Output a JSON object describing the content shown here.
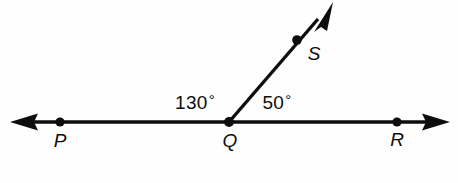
{
  "figure": {
    "background_color": "#fffefe",
    "stroke_color": "#0d0d0d",
    "width": 458,
    "height": 183
  },
  "points": [
    {
      "id": "P",
      "label": "P",
      "dot_x": 60,
      "dot_y": 122,
      "label_x": 60,
      "label_y": 131
    },
    {
      "id": "Q",
      "label": "Q",
      "dot_x": 229,
      "dot_y": 122,
      "label_x": 230,
      "label_y": 131
    },
    {
      "id": "R",
      "label": "R",
      "dot_x": 397,
      "dot_y": 122,
      "label_x": 397,
      "label_y": 130
    },
    {
      "id": "S",
      "label": "S",
      "dot_x": 297,
      "dot_y": 40,
      "label_x": 314,
      "label_y": 44
    }
  ],
  "lines": [
    {
      "id": "line-PR",
      "from": "P-arrow-left",
      "to": "R-arrow-right",
      "x1": 12,
      "y1": 122,
      "x2": 448,
      "y2": 122,
      "double_arrow": true
    },
    {
      "id": "ray-QS",
      "from": "Q",
      "to": "S-arrow",
      "x1": 229,
      "y1": 122,
      "x2": 332,
      "y2": 3,
      "double_arrow": false
    }
  ],
  "angles": [
    {
      "id": "angle-PQS",
      "value": "130",
      "degree_symbol": "°",
      "text": "130°",
      "x": 195,
      "y": 102
    },
    {
      "id": "angle-SQR",
      "value": "50",
      "degree_symbol": "°",
      "text": "50°",
      "x": 277,
      "y": 102
    }
  ]
}
